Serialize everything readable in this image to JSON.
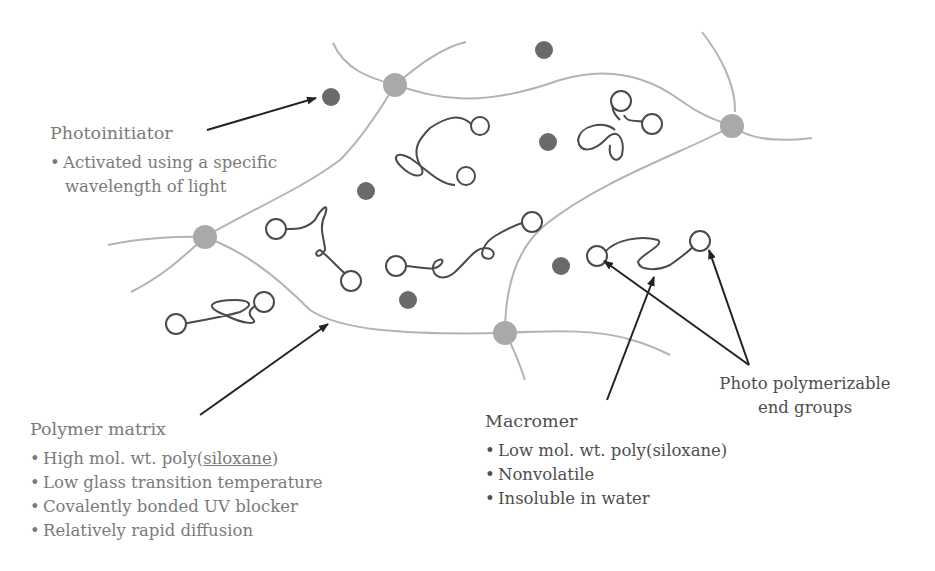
{
  "photoinitiator": {
    "title": "Photoinitiator",
    "bullets": [
      "Activated using a specific",
      "wavelength of light"
    ]
  },
  "polymer_matrix": {
    "title": "Polymer matrix",
    "bullets": [
      {
        "pre": "High mol. wt. poly(",
        "under": "siloxane",
        "post": ")"
      },
      "Low glass transition temperature",
      "Covalently bonded UV blocker",
      "Relatively rapid diffusion"
    ]
  },
  "macromer": {
    "title": "Macromer",
    "bullets": [
      "Low mol. wt. poly(siloxane)",
      "Nonvolatile",
      "Insoluble in water"
    ]
  },
  "end_groups": {
    "line1": "Photo polymerizable",
    "line2": "end groups"
  },
  "colors": {
    "matrix_line": "#b0b0b0",
    "crosslink_node": "#a9a9a9",
    "photoinitiator_dot": "#6a6a6a",
    "macromer_chain": "#4a4a4a",
    "arrow": "#222222",
    "light_text": "#7a7a7a",
    "dark_text": "#4e4e4e"
  }
}
